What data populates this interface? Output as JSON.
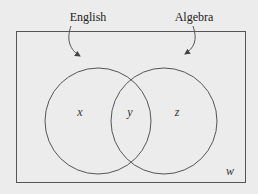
{
  "diagram": {
    "type": "venn",
    "universe_label": "w",
    "sets": [
      {
        "name": "English",
        "region_label": "x"
      },
      {
        "name": "Algebra",
        "region_label": "z"
      }
    ],
    "intersection_label": "y",
    "colors": {
      "background": "#ececec",
      "stroke": "#555555",
      "text": "#222222"
    }
  }
}
